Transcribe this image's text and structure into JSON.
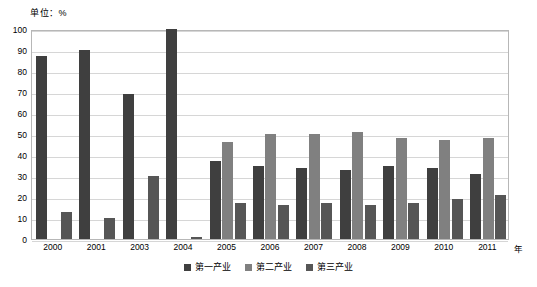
{
  "unit_label": "单位：%",
  "axis": {
    "x_title": "年",
    "y_ticks": [
      "0",
      "10",
      "20",
      "30",
      "40",
      "50",
      "60",
      "70",
      "80",
      "90",
      "100"
    ]
  },
  "legend": {
    "items": [
      {
        "label": "第一产业",
        "color": "#3f3f3f"
      },
      {
        "label": "第二产业",
        "color": "#808080"
      },
      {
        "label": "第三产业",
        "color": "#565656"
      }
    ]
  },
  "chart_data": {
    "type": "bar",
    "title": "",
    "xlabel": "年",
    "ylabel": "单位：%",
    "ylim": [
      0,
      100
    ],
    "ytick_step": 10,
    "grid": true,
    "legend_position": "bottom",
    "categories": [
      "2000",
      "2001",
      "2003",
      "2004",
      "2005",
      "2006",
      "2007",
      "2008",
      "2009",
      "2010",
      "2011"
    ],
    "series": [
      {
        "name": "第一产业",
        "color": "#3f3f3f",
        "values": [
          87,
          90,
          69,
          100,
          37,
          35,
          34,
          33,
          35,
          34,
          31
        ]
      },
      {
        "name": "第二产业",
        "color": "#808080",
        "values": [
          0,
          0,
          0,
          0,
          46,
          50,
          50,
          51,
          48,
          47,
          48
        ]
      },
      {
        "name": "第三产业",
        "color": "#565656",
        "values": [
          13,
          10,
          30,
          1,
          17,
          16,
          17,
          16,
          17,
          19,
          21
        ]
      }
    ]
  }
}
